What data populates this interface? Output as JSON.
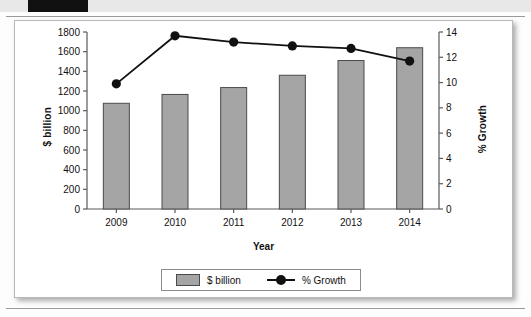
{
  "chart_data": {
    "type": "bar",
    "title": "",
    "subtitle": "",
    "xlabel": "Year",
    "ylabel": "$ billion",
    "y2label": "% Growth",
    "categories": [
      "2009",
      "2010",
      "2011",
      "2012",
      "2013",
      "2014"
    ],
    "series": [
      {
        "name": "$ billion",
        "type": "bar",
        "axis": "left",
        "values": [
          1075,
          1165,
          1235,
          1360,
          1510,
          1640
        ],
        "color": "#a5a5a5",
        "border_color": "#4a4a4a"
      },
      {
        "name": "% Growth",
        "type": "line",
        "axis": "right",
        "values": [
          9.9,
          13.7,
          13.2,
          12.9,
          12.7,
          11.7
        ],
        "color": "#111111",
        "marker": "circle"
      }
    ],
    "ylim": [
      0,
      1800
    ],
    "yticks": [
      0,
      200,
      400,
      600,
      800,
      1000,
      1200,
      1400,
      1600,
      1800
    ],
    "y2lim": [
      0,
      14
    ],
    "y2ticks": [
      0,
      2,
      4,
      6,
      8,
      10,
      12,
      14
    ],
    "grid": false,
    "legend": {
      "position": "bottom",
      "entries": [
        {
          "label": "$ billion",
          "marker": "swatch"
        },
        {
          "label": "% Growth",
          "marker": "line-dot"
        }
      ]
    }
  }
}
